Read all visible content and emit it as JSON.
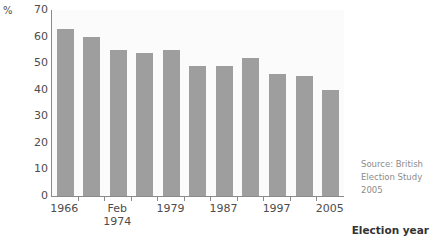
{
  "chart_data": {
    "type": "bar",
    "title": "",
    "subtitle": "",
    "xlabel": "Election year",
    "ylabel": "%",
    "categories": [
      "1966",
      "1970",
      "Feb 1974",
      "Oct 1974",
      "1979",
      "1983",
      "1987",
      "1992",
      "1997",
      "2001",
      "2005"
    ],
    "values": [
      63,
      60,
      55,
      54,
      55,
      49,
      49,
      52,
      46,
      45,
      40
    ],
    "ylim": [
      0,
      70
    ],
    "yticks": [
      "0",
      "10",
      "20",
      "30",
      "40",
      "50",
      "60",
      "70"
    ],
    "xtick_labels": [
      {
        "line1": "1966",
        "line2": ""
      },
      {
        "line1": "Feb",
        "line2": "1974"
      },
      {
        "line1": "1979",
        "line2": ""
      },
      {
        "line1": "1987",
        "line2": ""
      },
      {
        "line1": "1997",
        "line2": ""
      },
      {
        "line1": "2005",
        "line2": ""
      }
    ],
    "grid": false,
    "legend": "none",
    "bar_color": "#9e9e9e",
    "axis_color": "#8a8a8a",
    "text_color": "#4d4d4d"
  },
  "source_note": {
    "line1": "Source: British",
    "line2": "Election Study",
    "line3": "2005"
  }
}
